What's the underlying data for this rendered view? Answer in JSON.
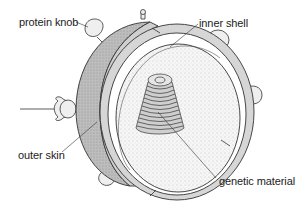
{
  "diagram": {
    "labels": [
      {
        "id": "protein-knob",
        "text": "protein knob",
        "x": 19,
        "y": 16
      },
      {
        "id": "inner-shell",
        "text": "inner shell",
        "x": 199,
        "y": 17
      },
      {
        "id": "outer-skin",
        "text": "outer skin",
        "x": 18,
        "y": 149
      },
      {
        "id": "genetic-material",
        "text": "genetic material",
        "x": 219,
        "y": 175
      }
    ],
    "colors": {
      "outer_skin_fill": "#b9b9b9",
      "shell_band_fill": "#d4d4d4",
      "interior_fill": "#f4f4f4",
      "knob_fill": "#efefef",
      "stroke": "#333333",
      "text": "#222222"
    }
  }
}
